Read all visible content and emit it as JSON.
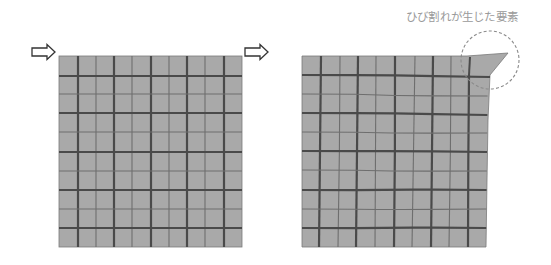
{
  "annotation": {
    "label": "ひび割れが生じた要素"
  },
  "colors": {
    "cell_fill": "#a9a9a9",
    "thick_line": "#4a4a4a",
    "thin_line": "#6e6e6e",
    "arrow_stroke": "#333333",
    "circle_stroke": "#8a8a8a",
    "label_text": "#9a9a9a"
  },
  "arrows": [
    {
      "name": "input-arrow-left-grid",
      "x0": 32,
      "tip": 55,
      "cy": 52
    },
    {
      "name": "input-arrow-right-grid",
      "x0": 245,
      "tip": 268,
      "cy": 52
    }
  ],
  "grids": {
    "original": {
      "rows": 10,
      "cols": 10,
      "left": 59,
      "top": 56,
      "right": 242,
      "bottom": 247,
      "v_lines": [
        78,
        96,
        114,
        132,
        151,
        169,
        187,
        205,
        224
      ],
      "h_lines": [
        76,
        94,
        113,
        132,
        152,
        171,
        190,
        209,
        228
      ],
      "thick_pattern": "alternating, starting thick"
    },
    "deformed": {
      "rows": 10,
      "cols": 10,
      "outline": [
        [
          302,
          56
        ],
        [
          467,
          56
        ],
        [
          508,
          53
        ],
        [
          490,
          75
        ],
        [
          488,
          120
        ],
        [
          487,
          180
        ],
        [
          486,
          247
        ],
        [
          302,
          247
        ]
      ],
      "v_lines_top": [
        321,
        340,
        358,
        376,
        395,
        415,
        433,
        451,
        469
      ],
      "v_lines_bottom": [
        319,
        338,
        356,
        375,
        394,
        412,
        431,
        449,
        468
      ],
      "h_lines_left": [
        75,
        94,
        113,
        132,
        151,
        170,
        190,
        209,
        228
      ],
      "h_lines_right": [
        77,
        96,
        115,
        133,
        152,
        171,
        190,
        209,
        228
      ],
      "right_edge_top": 488,
      "right_edge_bottom": 486,
      "cracked_element": {
        "polygon": [
          [
            467,
            56
          ],
          [
            508,
            53
          ],
          [
            490,
            75
          ],
          [
            470,
            75
          ]
        ]
      }
    }
  },
  "highlight_circle": {
    "cx": 490,
    "cy": 60,
    "r": 29
  }
}
